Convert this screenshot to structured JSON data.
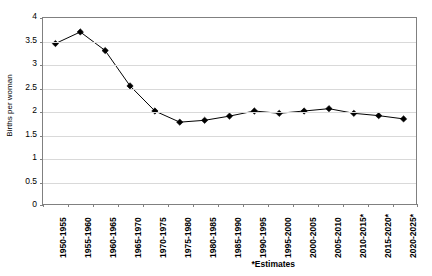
{
  "chart_data": {
    "type": "line",
    "title": "",
    "subtitle": "",
    "xlabel": "",
    "ylabel": "Births per woman",
    "ylim": [
      0,
      4
    ],
    "ytick_step": 0.5,
    "grid": true,
    "legend": null,
    "marker": "diamond",
    "line_color": "#000000",
    "marker_color": "#000000",
    "plot_border_color": "#808080",
    "gridline_color": "#d9d9d9",
    "background_color": "#ffffff",
    "categories": [
      "1950-1955",
      "1955-1960",
      "1960-1965",
      "1965-1970",
      "1970-1975",
      "1975-1980",
      "1980-1985",
      "1985-1990",
      "1990-1995",
      "1995-2000",
      "2000-2005",
      "2005-2010",
      "2010-2015*",
      "2015-2020*",
      "2020-2025*"
    ],
    "values": [
      3.45,
      3.7,
      3.3,
      2.54,
      2.0,
      1.76,
      1.8,
      1.89,
      2.0,
      1.95,
      2.0,
      2.05,
      1.95,
      1.9,
      1.83
    ],
    "yticks": [
      "0",
      "0.5",
      "1",
      "1.5",
      "2",
      "2.5",
      "3",
      "3.5",
      "4"
    ],
    "annotations": [
      "*Estimates"
    ]
  },
  "axis": {
    "y_title": "Births per woman"
  },
  "footnote": {
    "text": "*Estimates"
  }
}
